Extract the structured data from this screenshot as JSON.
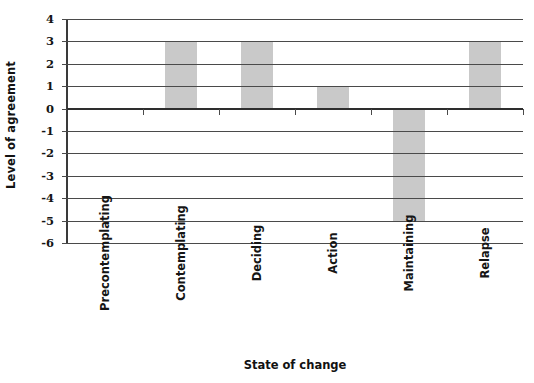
{
  "chart_data": {
    "type": "bar",
    "title": "",
    "xlabel": "State of change",
    "ylabel": "Level of agreement",
    "categories": [
      "Precontemplating",
      "Contemplating",
      "Deciding",
      "Action",
      "Maintaining",
      "Relapse"
    ],
    "values": [
      0,
      3,
      3,
      1,
      -5,
      3
    ],
    "ylim": [
      -6,
      4
    ],
    "ytick_labels": [
      "4",
      "3",
      "2",
      "1",
      "0",
      "-1",
      "-2",
      "-3",
      "-4",
      "-5",
      "-6"
    ],
    "ytick_values": [
      4,
      3,
      2,
      1,
      0,
      -1,
      -2,
      -3,
      -4,
      -5,
      -6
    ],
    "grid": true,
    "legend": false,
    "legend_position": "none",
    "bar_color": "#c9c9c9",
    "axis_color": "#4a4a4a",
    "zero_line_color": "#2e2e2e",
    "text_color": "#141414",
    "background": "#ffffff"
  }
}
